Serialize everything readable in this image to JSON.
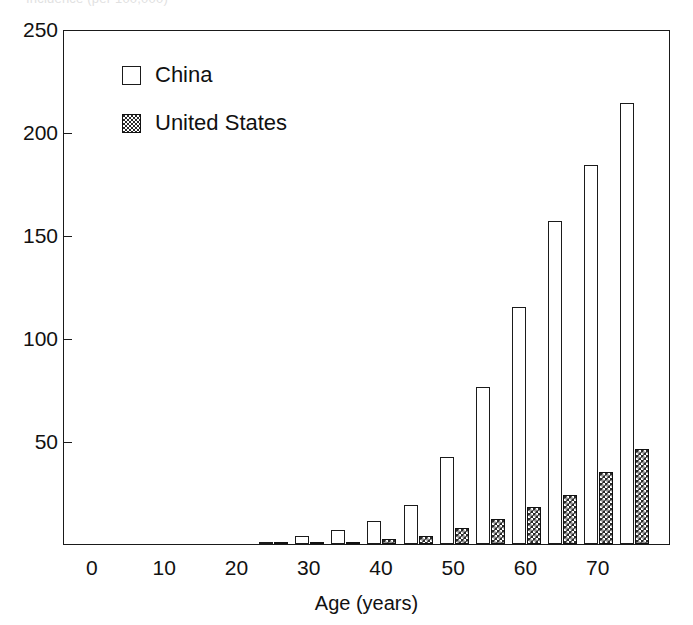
{
  "figure": {
    "clipped_top_text": "Incidence (per 100,000)",
    "background_color": "#ffffff",
    "ink_color": "#1a1a1a"
  },
  "legend": {
    "position": "top-left-inside",
    "entries": [
      {
        "label": "China",
        "swatch": "open-white-square",
        "color": "#ffffff"
      },
      {
        "label": "United States",
        "swatch": "dark-hatched-square",
        "color": "#2a2a2a"
      }
    ]
  },
  "axes": {
    "x": {
      "label": "Age (years)",
      "ticks": [
        "0",
        "10",
        "20",
        "30",
        "40",
        "50",
        "60",
        "70"
      ],
      "tick_values": [
        0,
        10,
        20,
        30,
        40,
        50,
        60,
        70
      ],
      "min": -4,
      "max": 80
    },
    "y": {
      "label": "",
      "ticks": [
        "50",
        "100",
        "150",
        "200",
        "250"
      ],
      "tick_values": [
        50,
        100,
        150,
        200,
        250
      ],
      "min": 0,
      "max": 250
    }
  },
  "chart_data": {
    "type": "bar",
    "title": "Incidence (per 100,000)",
    "xlabel": "Age (years)",
    "ylabel": "",
    "xlim": [
      -4,
      80
    ],
    "ylim": [
      0,
      250
    ],
    "grid": false,
    "legend_position": "upper left",
    "categories": [
      "25",
      "30",
      "35",
      "40",
      "45",
      "50",
      "55",
      "60",
      "65",
      "70",
      "75"
    ],
    "x": [
      25,
      30,
      35,
      40,
      45,
      50,
      55,
      60,
      65,
      70,
      75
    ],
    "series": [
      {
        "name": "China",
        "color": "#ffffff",
        "values": [
          1,
          4,
          7,
          11,
          19,
          42,
          76,
          115,
          157,
          184,
          214
        ]
      },
      {
        "name": "United States",
        "color": "#2a2a2a",
        "values": [
          0.4,
          0.6,
          1.2,
          2.2,
          4.0,
          8.0,
          12.0,
          18.0,
          24.0,
          35.0,
          46.0
        ]
      }
    ]
  }
}
